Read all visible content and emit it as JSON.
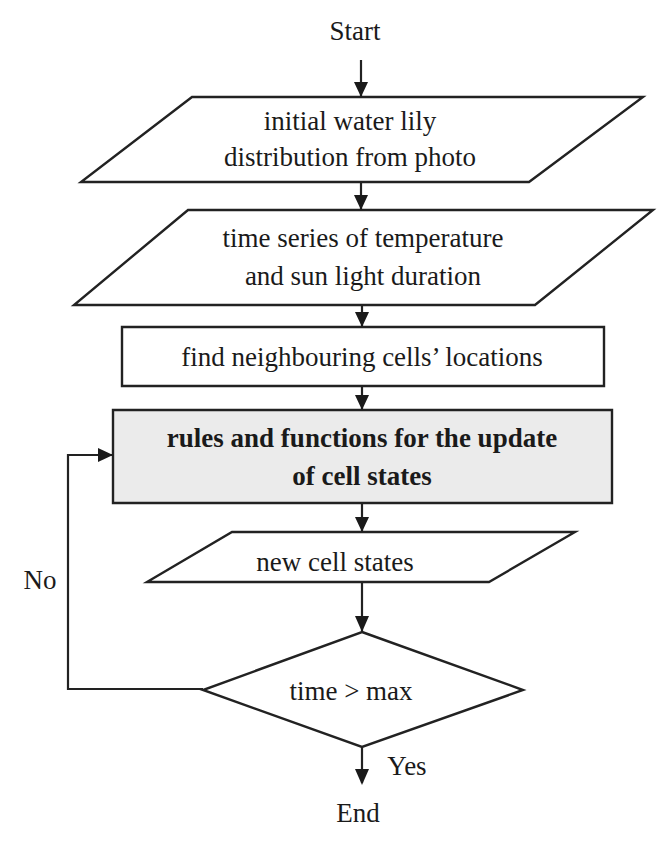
{
  "diagram": {
    "type": "flowchart",
    "colors": {
      "stroke": "#222222",
      "text": "#1a1a1a",
      "background": "#ffffff",
      "highlight_fill": "#ebebeb"
    },
    "terminals": {
      "start": {
        "label": "Start",
        "x": 355,
        "y": 40
      },
      "end": {
        "label": "End",
        "x": 358,
        "y": 822
      }
    },
    "nodes": [
      {
        "id": "initial-distribution",
        "shape": "parallelogram",
        "points": "192,97 643,97 529,182 81,182",
        "lines": [
          "initial water lily",
          "distribution from photo"
        ],
        "line_y": [
          130,
          166
        ],
        "cx": 350
      },
      {
        "id": "time-series",
        "shape": "parallelogram",
        "points": "188,210 653,210 535,305 74,305",
        "lines": [
          "time series of temperature",
          "and sun light duration"
        ],
        "line_y": [
          247,
          285
        ],
        "cx": 363
      },
      {
        "id": "find-neighbours",
        "shape": "rectangle",
        "points": "122,327 604,327 604,386 122,386",
        "lines": [
          "find neighbouring cells’ locations"
        ],
        "line_y": [
          366
        ],
        "cx": 362
      },
      {
        "id": "update-rules",
        "shape": "rectangle",
        "highlight": true,
        "points": "113,410 612,410 612,503 113,503",
        "lines": [
          "rules and functions for the update",
          "of cell states"
        ],
        "line_y": [
          447,
          485
        ],
        "cx": 362,
        "bold": true
      },
      {
        "id": "new-cell-states",
        "shape": "parallelogram",
        "points": "232,532 575,532 489,582 147,582",
        "lines": [
          "new cell states"
        ],
        "line_y": [
          571
        ],
        "cx": 335
      },
      {
        "id": "time-check",
        "shape": "diamond",
        "points": "362,632 523,690 362,747 203,690",
        "lines": [
          "time > max"
        ],
        "line_y": [
          700
        ],
        "cx": 351
      }
    ],
    "edges": [
      {
        "from": "start",
        "to": "initial-distribution",
        "path": "M361,60 L361,96"
      },
      {
        "from": "initial-distribution",
        "to": "time-series",
        "path": "M361,182 L361,209"
      },
      {
        "from": "time-series",
        "to": "find-neighbours",
        "path": "M362,305 L362,326"
      },
      {
        "from": "find-neighbours",
        "to": "update-rules",
        "path": "M362,386 L362,409"
      },
      {
        "from": "update-rules",
        "to": "new-cell-states",
        "path": "M362,503 L362,531"
      },
      {
        "from": "new-cell-states",
        "to": "time-check",
        "path": "M362,582 L362,631"
      },
      {
        "from": "time-check",
        "to": "end",
        "label": "Yes",
        "path": "M362,747 L362,783"
      },
      {
        "from": "time-check",
        "to": "update-rules",
        "label": "No",
        "path": "M203,689 L68,689 L68,455 L112,455"
      }
    ],
    "arrowheads": [
      "354,82 368,82 361,97",
      "354,195 368,195 361,210",
      "355,312 369,312 362,327",
      "355,395 369,395 362,410",
      "355,517 369,517 362,532",
      "355,616 369,616 362,632",
      "355,769 369,769 362,785",
      "98,448 98,462 113,455"
    ],
    "edge_labels": {
      "yes": {
        "text": "Yes",
        "x": 407,
        "y": 775
      },
      "no": {
        "text": "No",
        "x": 40,
        "y": 589
      }
    }
  }
}
